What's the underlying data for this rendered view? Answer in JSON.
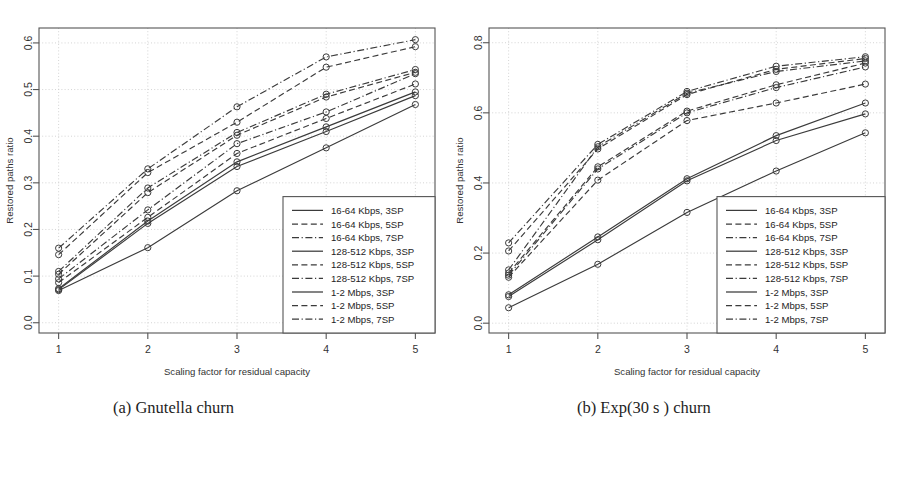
{
  "figure": {
    "subfigures": [
      {
        "tag": "panel-a",
        "caption": "(a) Gnutella churn"
      },
      {
        "tag": "panel-b",
        "caption": "(b) Exp(30 s ) churn"
      }
    ]
  },
  "chart_data": [
    {
      "type": "line",
      "title": "(a) Gnutella churn",
      "xlabel": "Scaling factor for residual capacity",
      "ylabel": "Restored paths ratio",
      "x": [
        1,
        2,
        3,
        4,
        5
      ],
      "xlim": [
        0.78,
        5.22
      ],
      "ylim": [
        -0.022,
        0.632
      ],
      "xticks": [
        1,
        2,
        3,
        4,
        5
      ],
      "xticklabels": [
        "1",
        "2",
        "3",
        "4",
        "5"
      ],
      "yticks": [
        0.0,
        0.1,
        0.2,
        0.3,
        0.4,
        0.5,
        0.6
      ],
      "yticklabels": [
        "0.0",
        "0.1",
        "0.2",
        "0.3",
        "0.4",
        "0.5",
        "0.6"
      ],
      "grid": true,
      "legend_position": "bottom-right",
      "markers": "open-circle",
      "series": [
        {
          "name": "16-64 Kbps, 3SP",
          "dash": "solid",
          "values": [
            0.071,
            0.213,
            0.335,
            0.41,
            0.487
          ]
        },
        {
          "name": "16-64 Kbps, 5SP",
          "dash": "dashed",
          "values": [
            0.086,
            0.226,
            0.363,
            0.438,
            0.512
          ]
        },
        {
          "name": "16-64 Kbps, 7SP",
          "dash": "dashdot",
          "values": [
            0.094,
            0.242,
            0.384,
            0.452,
            0.534
          ]
        },
        {
          "name": "128-512 Kbps, 3SP",
          "dash": "solid",
          "values": [
            0.073,
            0.218,
            0.345,
            0.42,
            0.495
          ]
        },
        {
          "name": "128-512 Kbps, 5SP",
          "dash": "dashed",
          "values": [
            0.104,
            0.279,
            0.402,
            0.484,
            0.537
          ]
        },
        {
          "name": "128-512 Kbps, 7SP",
          "dash": "dashdot",
          "values": [
            0.11,
            0.289,
            0.408,
            0.49,
            0.543
          ]
        },
        {
          "name": "1-2 Mbps, 3SP",
          "dash": "solid",
          "values": [
            0.069,
            0.161,
            0.283,
            0.375,
            0.468
          ]
        },
        {
          "name": "1-2 Mbps, 5SP",
          "dash": "dashed",
          "values": [
            0.146,
            0.322,
            0.43,
            0.548,
            0.592
          ]
        },
        {
          "name": "1-2 Mbps, 7SP",
          "dash": "dashdot",
          "values": [
            0.16,
            0.33,
            0.463,
            0.57,
            0.607
          ]
        }
      ],
      "legend_entries": [
        "16-64 Kbps, 3SP",
        "16-64 Kbps, 5SP",
        "16-64 Kbps, 7SP",
        "128-512 Kbps, 3SP",
        "128-512 Kbps, 5SP",
        "128-512 Kbps, 7SP",
        "1-2 Mbps, 3SP",
        "1-2 Mbps, 5SP",
        "1-2 Mbps, 7SP"
      ]
    },
    {
      "type": "line",
      "title": "(b) Exp(30 s ) churn",
      "xlabel": "Scaling factor for residual capacity",
      "ylabel": "Restored paths ratio",
      "x": [
        1,
        2,
        3,
        4,
        5
      ],
      "xlim": [
        0.78,
        5.22
      ],
      "ylim": [
        -0.028,
        0.842
      ],
      "xticks": [
        1,
        2,
        3,
        4,
        5
      ],
      "xticklabels": [
        "1",
        "2",
        "3",
        "4",
        "5"
      ],
      "yticks": [
        0.0,
        0.2,
        0.4,
        0.6,
        0.8
      ],
      "yticklabels": [
        "0.0",
        "0.2",
        "0.4",
        "0.6",
        "0.8"
      ],
      "grid": true,
      "legend_position": "bottom-right",
      "markers": "open-circle",
      "series": [
        {
          "name": "16-64 Kbps, 3SP",
          "dash": "solid",
          "values": [
            0.076,
            0.238,
            0.406,
            0.521,
            0.597
          ]
        },
        {
          "name": "16-64 Kbps, 5SP",
          "dash": "dashed",
          "values": [
            0.131,
            0.408,
            0.578,
            0.628,
            0.682
          ]
        },
        {
          "name": "16-64 Kbps, 7SP",
          "dash": "dashdot",
          "values": [
            0.137,
            0.44,
            0.6,
            0.672,
            0.731
          ]
        },
        {
          "name": "128-512 Kbps, 3SP",
          "dash": "solid",
          "values": [
            0.081,
            0.246,
            0.412,
            0.535,
            0.628
          ]
        },
        {
          "name": "128-512 Kbps, 5SP",
          "dash": "dashed",
          "values": [
            0.143,
            0.446,
            0.605,
            0.68,
            0.742
          ]
        },
        {
          "name": "128-512 Kbps, 7SP",
          "dash": "dashdot",
          "values": [
            0.152,
            0.503,
            0.656,
            0.718,
            0.748
          ]
        },
        {
          "name": "1-2 Mbps, 3SP",
          "dash": "solid",
          "values": [
            0.044,
            0.168,
            0.316,
            0.434,
            0.543
          ]
        },
        {
          "name": "1-2 Mbps, 5SP",
          "dash": "dashed",
          "values": [
            0.206,
            0.497,
            0.652,
            0.724,
            0.755
          ]
        },
        {
          "name": "1-2 Mbps, 7SP",
          "dash": "dashdot",
          "values": [
            0.229,
            0.51,
            0.661,
            0.733,
            0.76
          ]
        }
      ],
      "legend_entries": [
        "16-64 Kbps, 3SP",
        "16-64 Kbps, 5SP",
        "16-64 Kbps, 7SP",
        "128-512 Kbps, 3SP",
        "128-512 Kbps, 5SP",
        "128-512 Kbps, 7SP",
        "1-2 Mbps, 3SP",
        "1-2 Mbps, 5SP",
        "1-2 Mbps, 7SP"
      ]
    }
  ]
}
